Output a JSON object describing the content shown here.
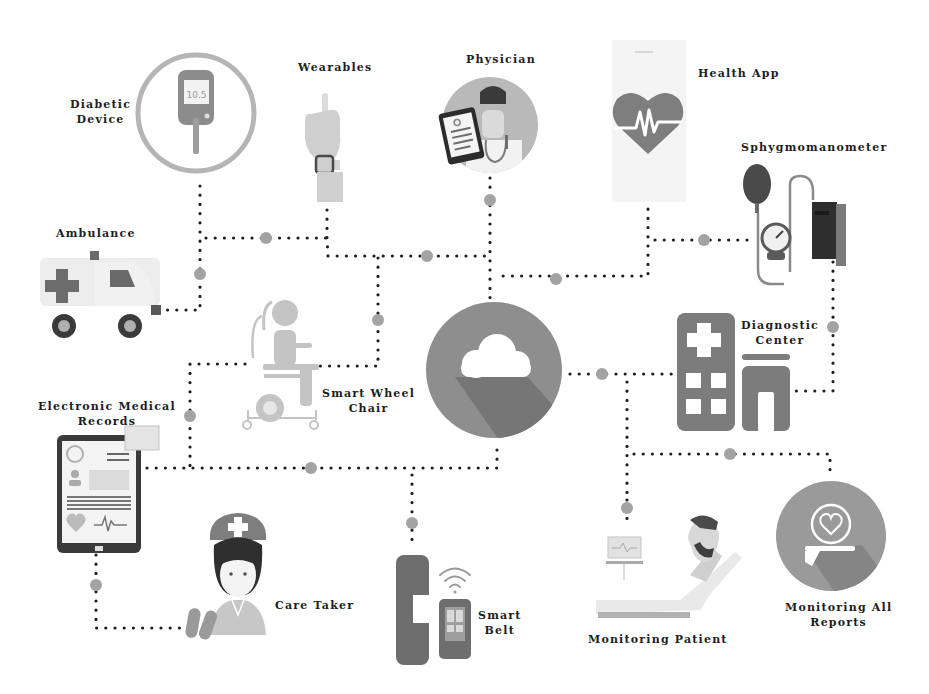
{
  "diagram": {
    "hub": {
      "name": "Cloud",
      "icon": "cloud-icon"
    },
    "colors": {
      "background": "#ffffff",
      "hub_circle": "#8c8c8c",
      "hub_shadow": "#6e6e6e",
      "dark_gray": "#555555",
      "mid_gray": "#8a8a8a",
      "light_gray": "#c8c8c8",
      "connector_dot": "#1e1e1e",
      "connector_node": "#a0a0a0",
      "label_text": "#1e1e1e"
    },
    "nodes": [
      {
        "id": "diabetic-device",
        "label_line1": "Diabetic",
        "label_line2": "Device",
        "icon": "glucose-meter-icon",
        "screen_text": "10.5"
      },
      {
        "id": "wearables",
        "label_line1": "Wearables",
        "label_line2": "",
        "icon": "smartwatch-hand-icon"
      },
      {
        "id": "physician",
        "label_line1": "Physician",
        "label_line2": "",
        "icon": "doctor-icon"
      },
      {
        "id": "health-app",
        "label_line1": "Health App",
        "label_line2": "",
        "icon": "heart-pulse-phone-icon"
      },
      {
        "id": "sphygmomanometer",
        "label_line1": "Sphygmomanometer",
        "label_line2": "",
        "icon": "blood-pressure-cuff-icon"
      },
      {
        "id": "ambulance",
        "label_line1": "Ambulance",
        "label_line2": "",
        "icon": "ambulance-icon"
      },
      {
        "id": "smart-wheel-chair",
        "label_line1": "Smart Wheel",
        "label_line2": "Chair",
        "icon": "wheelchair-icon"
      },
      {
        "id": "diagnostic-center",
        "label_line1": "Diagnostic",
        "label_line2": "Center",
        "icon": "hospital-building-icon"
      },
      {
        "id": "electronic-medical-records",
        "label_line1": "Electronic Medical",
        "label_line2": "Records",
        "icon": "tablet-records-icon"
      },
      {
        "id": "care-taker",
        "label_line1": "Care Taker",
        "label_line2": "",
        "icon": "nurse-icon"
      },
      {
        "id": "smart-belt",
        "label_line1": "Smart",
        "label_line2": "Belt",
        "icon": "belt-phone-wifi-icon"
      },
      {
        "id": "monitoring-patient",
        "label_line1": "Monitoring Patient",
        "label_line2": "",
        "icon": "patient-bed-monitor-icon"
      },
      {
        "id": "monitoring-all-reports",
        "label_line1": "Monitoring All",
        "label_line2": "Reports",
        "icon": "hand-heart-care-icon"
      }
    ]
  }
}
